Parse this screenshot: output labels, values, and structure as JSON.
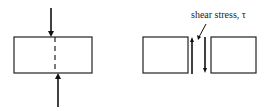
{
  "diagram": {
    "left_panel": {
      "description": "block under transverse load with dashed shear plane"
    },
    "right_panel": {
      "label": "shear stress, τ"
    }
  }
}
